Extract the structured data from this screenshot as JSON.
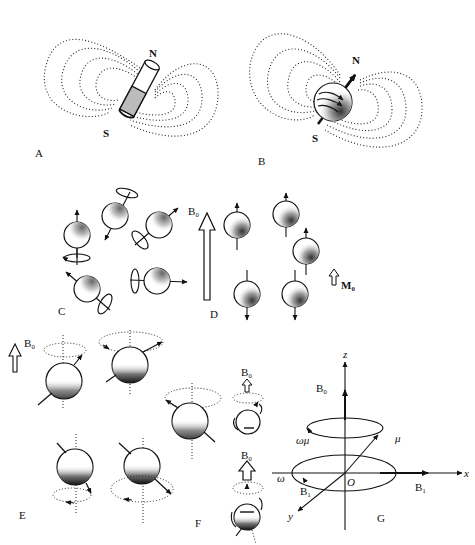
{
  "figure": {
    "panels": [
      {
        "id": "A",
        "label": "A",
        "north": "N",
        "south": "S",
        "object": "bar-magnet"
      },
      {
        "id": "B",
        "label": "B",
        "north": "N",
        "south": "S",
        "object": "spinning-nucleus"
      },
      {
        "id": "C",
        "label": "C",
        "object": "randomly-oriented-spins"
      },
      {
        "id": "D",
        "label": "D",
        "field_label": "B₀",
        "magnetization_label": "M₀",
        "object": "aligned-spins"
      },
      {
        "id": "E",
        "label": "E",
        "field_label": "B₀",
        "object": "precessing-spins"
      },
      {
        "id": "F",
        "label": "F",
        "field_labels": [
          "B₀",
          "B₀"
        ],
        "object": "spin-states"
      },
      {
        "id": "G",
        "label": "G",
        "object": "rotating-frame",
        "axes": {
          "z": "z",
          "x": "x",
          "y": "y",
          "origin": "O"
        },
        "labels": {
          "b0": "B₀",
          "mu": "μ",
          "omega_mu": "ωμ",
          "omega": "ω",
          "b1_left": "B₁",
          "b1_right": "B₁"
        }
      }
    ]
  }
}
